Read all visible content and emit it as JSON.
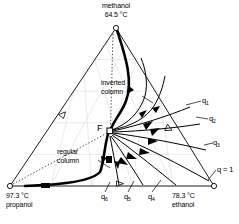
{
  "figure": {
    "type": "ternary-distillation-diagram",
    "system": "methanol-ethanol-propanol"
  },
  "vertices": {
    "top": {
      "component": "methanol",
      "temperature": "64.5 °C",
      "marker": "open-circle",
      "x": 116,
      "y": 28
    },
    "bottom_left": {
      "component": "propanol",
      "temperature": "97.3 °C",
      "marker": "open-circle",
      "x": 10,
      "y": 186
    },
    "bottom_right": {
      "component": "ethanol",
      "temperature": "78.3 °C",
      "marker": "open-circle",
      "x": 214,
      "y": 186
    }
  },
  "feed": {
    "label": "F",
    "marker": "open-square",
    "x": 110,
    "y": 131
  },
  "annotations": {
    "inverted_column": "inverted\ncolumn",
    "inverted_column_line1": "inverted",
    "inverted_column_line2": "column",
    "regular_column_line1": "regular",
    "regular_column_line2": "column"
  },
  "q_labels": {
    "right": [
      {
        "text": "q",
        "sub": "1",
        "x": 204,
        "y": 103
      },
      {
        "text": "q",
        "sub": "2",
        "x": 211,
        "y": 121
      },
      {
        "text": "q",
        "sub": "3",
        "x": 215,
        "y": 145
      }
    ],
    "bottom": [
      {
        "text": "q",
        "sub": "6",
        "x": 103,
        "y": 197
      },
      {
        "text": "q",
        "sub": "5",
        "x": 126,
        "y": 197
      },
      {
        "text": "q",
        "sub": "4",
        "x": 150,
        "y": 197
      }
    ],
    "vertex": {
      "text": "q = 1",
      "x": 218,
      "y": 172
    }
  },
  "colors": {
    "line": "#000000",
    "grid": "#c8c8c8",
    "background": "#ffffff"
  }
}
